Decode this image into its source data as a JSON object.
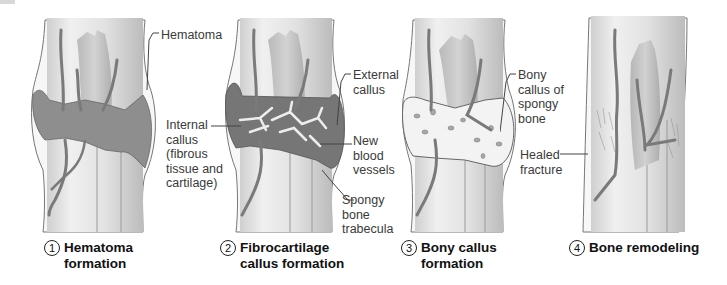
{
  "stages": [
    {
      "number": "1",
      "title_line1": "Hematoma",
      "title_line2": "formation"
    },
    {
      "number": "2",
      "title_line1": "Fibrocartilage",
      "title_line2": "callus formation"
    },
    {
      "number": "3",
      "title_line1": "Bony callus",
      "title_line2": "formation"
    },
    {
      "number": "4",
      "title_line1": "Bone remodeling",
      "title_line2": ""
    }
  ],
  "labels": {
    "hematoma": "Hematoma",
    "internal_callus": "Internal\ncallus\n(fibrous\ntissue and\ncartilage)",
    "external_callus": "External\ncallus",
    "new_blood_vessels": "New\nblood\nvessels",
    "spongy_bone_trabecula": "Spongy\nbone\ntrabecula",
    "bony_callus": "Bony\ncallus of\nspongy\nbone",
    "healed_fracture": "Healed\nfracture"
  },
  "colors": {
    "bone_fill": "#e6e6e6",
    "bone_shade": "#bdbdbd",
    "hematoma": "#8c8c8c",
    "vessel": "#7a7a7a",
    "callus": "#f2f2f2",
    "outline": "#555555",
    "text": "#3a3a3a"
  }
}
